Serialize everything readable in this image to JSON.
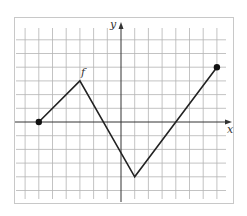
{
  "chart_data": {
    "type": "line",
    "title": "",
    "function_label": "f",
    "xlabel": "x",
    "ylabel": "y",
    "xlim": [
      -7,
      7
    ],
    "ylim": [
      -5,
      6
    ],
    "grid": true,
    "grid_step": 1,
    "tick_labels": false,
    "series": [
      {
        "name": "f",
        "points": [
          [
            -6,
            0
          ],
          [
            -3,
            3
          ],
          [
            1,
            -4
          ],
          [
            7,
            4
          ]
        ],
        "endpoints_closed": [
          [
            -6,
            0
          ],
          [
            7,
            4
          ]
        ]
      }
    ],
    "x_intercepts": [
      -6,
      -1.29,
      4
    ],
    "colors": {
      "grid": "#b4b4b4",
      "axis": "#333333",
      "line": "#222222",
      "frame": "#c8c8c8"
    }
  },
  "labels": {
    "x_axis": "x",
    "y_axis": "y",
    "function": "f"
  }
}
